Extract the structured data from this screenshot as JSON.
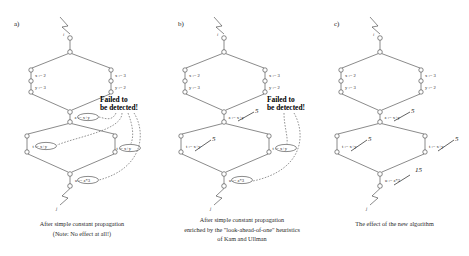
{
  "figure": {
    "panels": [
      {
        "id": "a",
        "label": "a)",
        "caption_line1": "After simple constant propagation",
        "caption_line2": "(Note: No effect at all!)",
        "annotation": {
          "line1": "Failed to",
          "line2": "be detected!"
        },
        "statements": {
          "left_x": "x := 2",
          "left_y": "y := 3",
          "right_x": "x := 3",
          "right_y": "y := 2",
          "merge_z": "z := x+y",
          "mid_left_t": "t := x+y",
          "mid_right_t": "t := x+y",
          "bottom_u": "u := z*3"
        },
        "computed_values": {
          "merge_z": "",
          "mid_left_t": "",
          "mid_right_t": "",
          "bottom_u": ""
        },
        "struck": {
          "merge_z": false,
          "mid_left_t": false,
          "mid_right_t": false,
          "bottom_u": false
        },
        "entry_label": "i",
        "exit_label": "j"
      },
      {
        "id": "b",
        "label": "b)",
        "caption_line1": "After simple constant propagation",
        "caption_line2": "enriched by the \"look-ahead-of-one\" heuristics",
        "caption_line3": "of Kam and Ullman",
        "annotation": {
          "line1": "Failed to",
          "line2": "be detected!"
        },
        "statements": {
          "left_x": "x := 2",
          "left_y": "y := 3",
          "right_x": "x := 3",
          "right_y": "y := 2",
          "merge_z": "z := x+y",
          "mid_left_t": "t := x+y",
          "mid_right_t": "t := x+y",
          "bottom_u": "u := z*3"
        },
        "computed_values": {
          "merge_z": "5",
          "mid_left_t": "5",
          "mid_right_t": "",
          "bottom_u": ""
        },
        "struck": {
          "merge_z": true,
          "mid_left_t": true,
          "mid_right_t": false,
          "bottom_u": false
        },
        "entry_label": "i",
        "exit_label": "j"
      },
      {
        "id": "c",
        "label": "c)",
        "caption_line1": "The effect of the new algorithm",
        "caption_line2": "",
        "caption_line3": "",
        "annotation": {
          "line1": "",
          "line2": ""
        },
        "statements": {
          "left_x": "x := 2",
          "left_y": "y := 3",
          "right_x": "x := 3",
          "right_y": "y := 2",
          "merge_z": "z := x+y",
          "mid_left_t": "t := x+y",
          "mid_right_t": "t := x+y",
          "bottom_u": "u := z*3"
        },
        "computed_values": {
          "merge_z": "5",
          "mid_left_t": "5",
          "mid_right_t": "5",
          "bottom_u": "15"
        },
        "struck": {
          "merge_z": true,
          "mid_left_t": true,
          "mid_right_t": true,
          "bottom_u": true
        },
        "entry_label": "i",
        "exit_label": "j"
      }
    ]
  },
  "colors": {
    "ink": "#2b2b2b",
    "background": "#ffffff",
    "alert": "#000000"
  }
}
